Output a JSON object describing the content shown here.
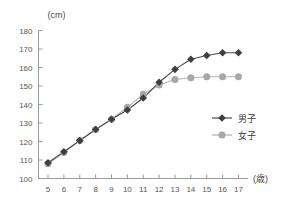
{
  "chart_data": {
    "type": "line",
    "title": "",
    "xlabel": "(歳)",
    "ylabel": "(cm)",
    "x": [
      5,
      6,
      7,
      8,
      9,
      10,
      11,
      12,
      13,
      14,
      15,
      16,
      17
    ],
    "xticklabels": [
      "5",
      "6",
      "7",
      "8",
      "9",
      "10",
      "11",
      "12",
      "13",
      "14",
      "15",
      "16",
      "17"
    ],
    "yticklabels": [
      "100",
      "110",
      "120",
      "130",
      "140",
      "150",
      "160",
      "170",
      "180"
    ],
    "yticks": [
      100,
      110,
      120,
      130,
      140,
      150,
      160,
      170,
      180
    ],
    "xlim": [
      4.4,
      17.6
    ],
    "ylim": [
      100,
      180
    ],
    "grid": false,
    "legend_position": "right-middle",
    "series": [
      {
        "name": "男子",
        "marker": "diamond",
        "color": "#3f3f3f",
        "line_color": "#4a4a4a",
        "values": [
          108.5,
          114.5,
          120.5,
          126.5,
          132.0,
          137.0,
          143.5,
          152.0,
          159.0,
          164.5,
          166.5,
          168.0,
          168.0
        ]
      },
      {
        "name": "女子",
        "marker": "circle",
        "color": "#a8a8a8",
        "line_color": "#b4b4b4",
        "values": [
          108.0,
          114.0,
          120.5,
          126.5,
          132.0,
          138.5,
          145.5,
          150.5,
          153.5,
          154.5,
          155.0,
          155.0,
          155.0
        ]
      }
    ]
  },
  "axes": {
    "y_unit_label": "(cm)",
    "x_unit_label": "(歳)"
  },
  "legend": {
    "items": [
      {
        "label": "男子",
        "marker": "diamond-marker",
        "color": "#3f3f3f"
      },
      {
        "label": "女子",
        "marker": "circle-marker",
        "color": "#a8a8a8"
      }
    ]
  },
  "colors": {
    "axis": "#9a9a9a",
    "boys": "#3f3f3f",
    "girls": "#a8a8a8",
    "background": "#ffffff",
    "text": "#3a3a3a"
  }
}
